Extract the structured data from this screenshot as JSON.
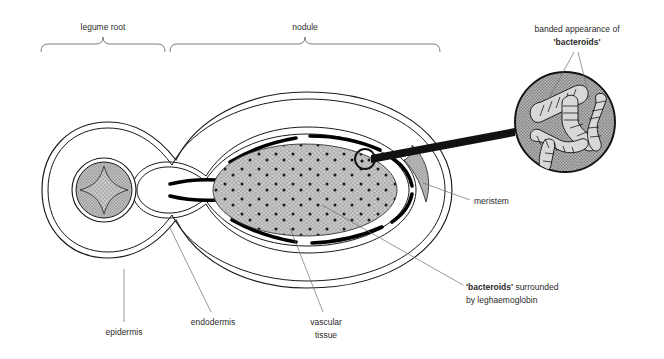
{
  "figure": {
    "kind": "biology-diagram"
  },
  "colors": {
    "ink": "#1a1a1a",
    "label_ink": "#2b2b2b",
    "leader": "#6e6e6e",
    "bracket": "#5a5a5a",
    "stipple_fill": "#c8c8c8",
    "stipple_dot": "#1a1a1a",
    "magnifier_fill": "#b4b4b4",
    "vascular_black": "#000000",
    "page": "#ffffff"
  },
  "brackets": [
    {
      "id": "legume-root",
      "label": "legume root"
    },
    {
      "id": "nodule",
      "label": "nodule"
    }
  ],
  "callouts": {
    "banded": {
      "line1": "banded appearance of",
      "line2": "'bacteroids'"
    },
    "meristem": {
      "label": "meristem"
    },
    "bacteroids_leg": {
      "line1_bold": "'bacteroids'",
      "line1_rest": " surrounded",
      "line2": "by leghaemoglobin"
    }
  },
  "labels": [
    {
      "id": "epidermis",
      "label": "epidermis"
    },
    {
      "id": "endodermis",
      "label": "endodermis"
    },
    {
      "id": "vascular-tissue",
      "line1": "vascular",
      "line2": "tissue"
    }
  ],
  "structures": {
    "root_stele": "four-pointed star vascular bundle in stippled circle",
    "infected_zone": "stippled ellipse with scattered dark dots",
    "vascular_arcs": "thick black dashed arcs around infected zone",
    "meristem_shape": "stippled crescent at nodule apex",
    "magnifier": "stippled circle containing four banded bacteroids"
  }
}
